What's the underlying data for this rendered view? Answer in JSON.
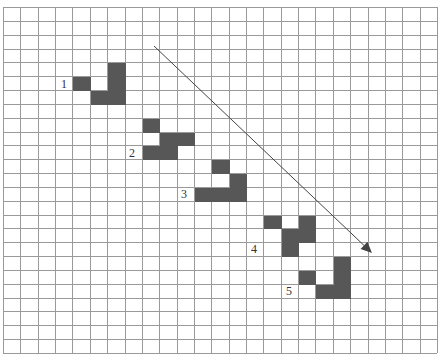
{
  "diagram": {
    "title": "",
    "grid": {
      "columns": 25,
      "rows": 25,
      "origin_x": 3,
      "origin_y": 7,
      "cell_width": 17.36,
      "cell_height": 13.84,
      "line_color": "#9a9a9a"
    },
    "fill_color": "#575757",
    "shapes": [
      {
        "label": "1",
        "label_pos": {
          "x": 61,
          "y": 88
        },
        "cells": [
          [
            4,
            5
          ],
          [
            6,
            4
          ],
          [
            6,
            5
          ],
          [
            5,
            6
          ],
          [
            6,
            6
          ]
        ]
      },
      {
        "label": "2",
        "label_pos": {
          "x": 129,
          "y": 157
        },
        "cells": [
          [
            8,
            8
          ],
          [
            9,
            9
          ],
          [
            10,
            9
          ],
          [
            8,
            10
          ],
          [
            9,
            10
          ]
        ]
      },
      {
        "label": "3",
        "label_pos": {
          "x": 181,
          "y": 198
        },
        "cells": [
          [
            12,
            11
          ],
          [
            13,
            12
          ],
          [
            11,
            13
          ],
          [
            12,
            13
          ],
          [
            13,
            13
          ]
        ]
      },
      {
        "label": "4",
        "label_pos": {
          "x": 251,
          "y": 253
        },
        "cells": [
          [
            15,
            15
          ],
          [
            17,
            15
          ],
          [
            16,
            16
          ],
          [
            17,
            16
          ],
          [
            16,
            17
          ]
        ]
      },
      {
        "label": "5",
        "label_pos": {
          "x": 286,
          "y": 295
        },
        "cells": [
          [
            19,
            18
          ],
          [
            17,
            19
          ],
          [
            19,
            19
          ],
          [
            18,
            20
          ],
          [
            19,
            20
          ]
        ]
      }
    ],
    "arrow": {
      "x1": 154,
      "y1": 46,
      "x2": 372,
      "y2": 253,
      "color": "#444444",
      "direction": "down-right"
    }
  }
}
